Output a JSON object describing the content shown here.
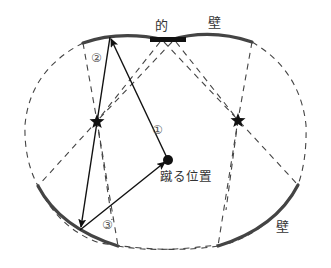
{
  "diagram": {
    "labels": {
      "target": "的",
      "wall_top": "壁",
      "wall_bottom_right": "壁",
      "kick_position": "蹴る位置"
    },
    "path_markers": {
      "path1": "①",
      "path2": "②",
      "path3": "③"
    },
    "colors": {
      "wall": "#444444",
      "dashed": "#444444",
      "arrow": "#111111",
      "target": "#111111"
    },
    "points": {
      "kick_position": [
        168,
        160
      ],
      "bounce_top": [
        110,
        37
      ],
      "bounce_bottom_left": [
        80,
        230
      ],
      "star_left": [
        97,
        121
      ],
      "star_right": [
        238,
        120
      ],
      "target_center": [
        168,
        40
      ]
    }
  }
}
